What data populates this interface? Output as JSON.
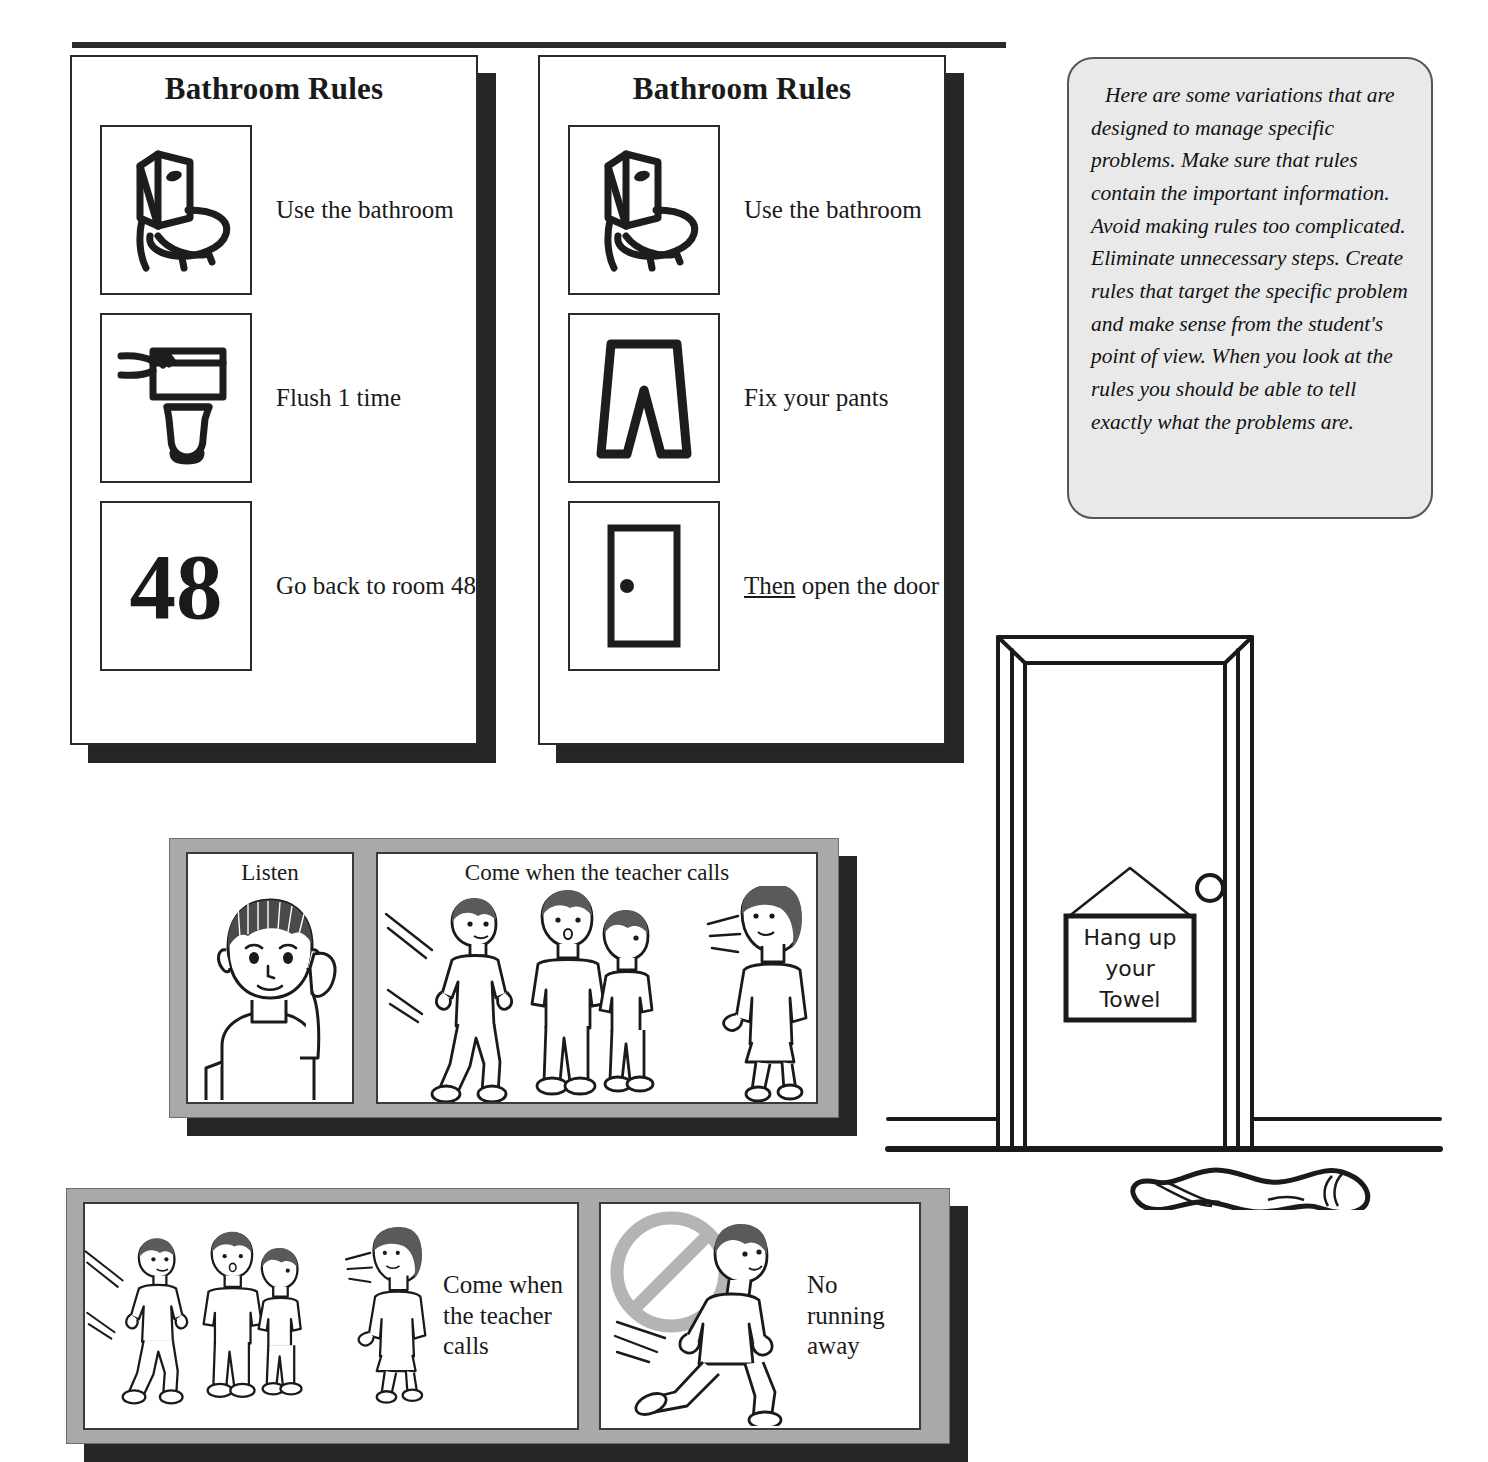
{
  "tipbox": {
    "text": "Here are some variations that are designed to manage specific problems.  Make sure that rules contain the important information.  Avoid making rules too complicated.  Eliminate unnecessary steps.  Create rules that target the specific problem and make sense from the student's point of view.  When you look at the rules you should be able to tell exactly what the problems are."
  },
  "cards": [
    {
      "title": "Bathroom Rules",
      "rules": [
        {
          "icon": "toilet-icon",
          "label": "Use the bathroom"
        },
        {
          "icon": "flush-hand-icon",
          "label": "Flush 1 time"
        },
        {
          "icon": "room-number-icon",
          "icon_text": "48",
          "label": "Go back to room 48"
        }
      ]
    },
    {
      "title": "Bathroom Rules",
      "rules": [
        {
          "icon": "toilet-icon",
          "label": "Use the bathroom"
        },
        {
          "icon": "pants-icon",
          "label": "Fix your pants"
        },
        {
          "icon": "door-icon",
          "label_prefix": "Then",
          "label_rest": " open the door"
        }
      ]
    }
  ],
  "boards": [
    {
      "name": "listen-board",
      "tiles": [
        {
          "caption": "Listen",
          "art": "child-listening-icon"
        },
        {
          "caption": "Come when the teacher calls",
          "art": "students-and-teacher-icon"
        }
      ]
    },
    {
      "name": "come-when-called-board",
      "tiles": [
        {
          "art": "students-and-teacher-icon",
          "side_label": "Come when the teacher calls"
        },
        {
          "art": "no-running-icon",
          "side_label": "No running away"
        }
      ]
    }
  ],
  "door_scene": {
    "sign_lines": [
      "Hang up",
      "your",
      "Towel"
    ],
    "elements": [
      "door-frame",
      "door-knob",
      "hanging-sign",
      "floor-line",
      "towel-on-floor"
    ]
  },
  "colors": {
    "ink": "#1a1a1a",
    "board_gray": "#a9a9a9",
    "shadow": "#262626",
    "tip_fill": "#e9e9e9",
    "prohibit_gray": "#b4b4b4"
  }
}
